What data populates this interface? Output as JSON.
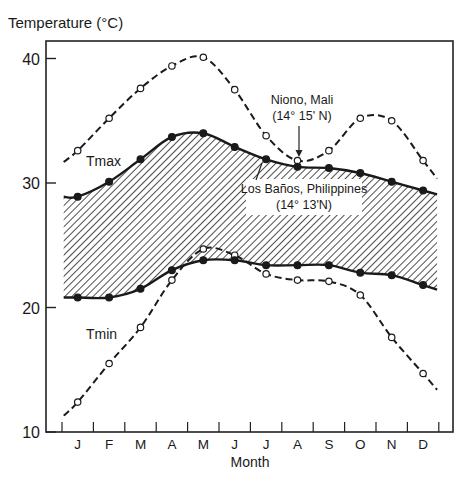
{
  "chart_data": {
    "type": "line",
    "title": "",
    "ylabel": "Temperature (°C)",
    "ylabel_display": "Temperature (oC)",
    "xlabel": "Month",
    "ylim": [
      10,
      41.3
    ],
    "yticks": [
      10,
      20,
      30,
      40
    ],
    "categories": [
      "J",
      "F",
      "M",
      "A",
      "M",
      "J",
      "J",
      "A",
      "S",
      "O",
      "N",
      "D"
    ],
    "grid": false,
    "series": [
      {
        "name": "Niono, Mali Tmax",
        "style": "dashed-open-circles",
        "values": [
          32.6,
          35.2,
          37.6,
          39.4,
          40.1,
          37.5,
          33.8,
          31.8,
          32.6,
          35.2,
          35.0,
          31.8
        ]
      },
      {
        "name": "Niono, Mali Tmin",
        "style": "dashed-open-circles",
        "values": [
          12.4,
          15.5,
          18.4,
          22.2,
          24.7,
          24.2,
          22.7,
          22.2,
          22.1,
          21.0,
          17.6,
          14.7
        ]
      },
      {
        "name": "Los Baños, Philippines Tmax",
        "style": "solid-filled-circles",
        "values": [
          28.9,
          30.1,
          31.9,
          33.7,
          34.0,
          32.9,
          31.9,
          31.3,
          31.2,
          30.8,
          30.1,
          29.4
        ]
      },
      {
        "name": "Los Baños, Philippines Tmin",
        "style": "solid-filled-circles",
        "values": [
          20.8,
          20.8,
          21.5,
          23.0,
          23.8,
          23.8,
          23.4,
          23.4,
          23.4,
          22.8,
          22.6,
          21.8
        ]
      }
    ],
    "shaded_band": "Between Los Baños Tmax and Tmin (hatched)",
    "annotations": [
      {
        "text": "Tmax",
        "near": "upper curves, Feb-Mar"
      },
      {
        "text": "Tmin",
        "near": "lower curves, Feb-Mar"
      },
      {
        "text": "Niono, Mali",
        "sub": "(14° 15' N)",
        "arrow_to": "Aug Niono Tmax point"
      },
      {
        "text": "Los Baños, Philippines",
        "sub": "(14° 13'N)",
        "arrow_to": "Jul Los Baños Tmax point"
      }
    ]
  },
  "labels": {
    "ylabel": "Temperature (°C)",
    "xlabel": "Month",
    "tmax": "Tmax",
    "tmin": "Tmin",
    "niono_name": "Niono, Mali",
    "niono_lat": "(14° 15' N)",
    "losbanos_name": "Los Baños, Philippines",
    "losbanos_lat": "(14° 13'N)"
  }
}
